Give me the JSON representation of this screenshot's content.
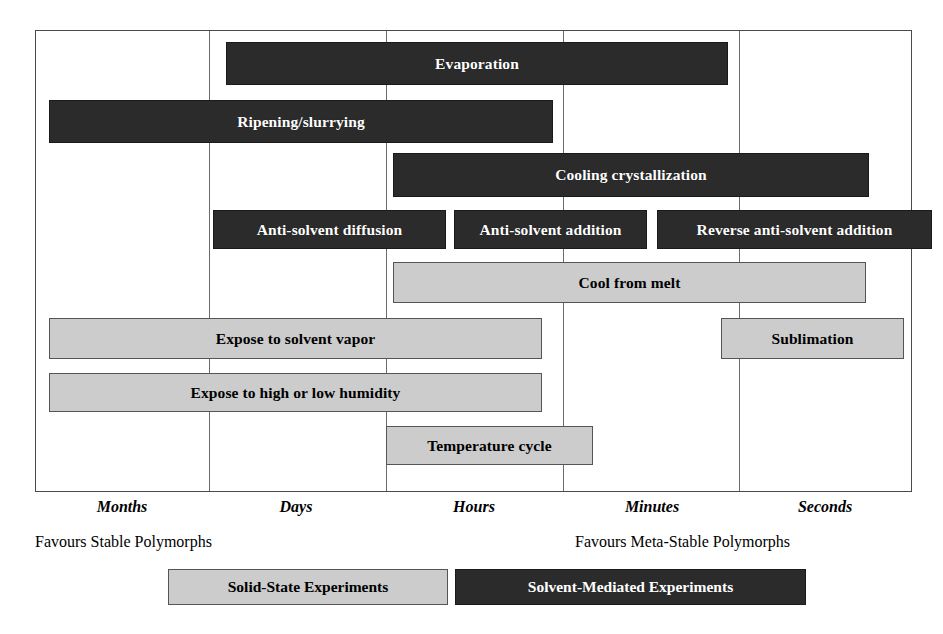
{
  "figure": {
    "colors": {
      "solid_state": "#cccccc",
      "solvent_mediated": "#2b2b2b",
      "frame": "#4a4a4a",
      "gridline": "#6b6b6b",
      "background": "#ffffff"
    }
  },
  "axis": {
    "label": "Timescale",
    "ticks": [
      {
        "label": "Months",
        "x": 122
      },
      {
        "label": "Days",
        "x": 296
      },
      {
        "label": "Hours",
        "x": 474
      },
      {
        "label": "Minutes",
        "x": 652
      },
      {
        "label": "Seconds",
        "x": 825
      }
    ],
    "gridline_positions": [
      208,
      385,
      562,
      738
    ]
  },
  "captions": {
    "left": "Favours Stable Polymorphs",
    "right": "Favours Meta-Stable Polymorphs"
  },
  "legend": {
    "items": [
      {
        "label": "Solid-State Experiments",
        "type": "solid_state"
      },
      {
        "label": "Solvent-Mediated Experiments",
        "type": "solvent_mediated"
      }
    ]
  },
  "chart_data": {
    "type": "bar",
    "xlabel": "Timescale",
    "ylabel": "",
    "grid": true,
    "legend_position": "bottom",
    "categories": [
      "Months",
      "Days",
      "Hours",
      "Minutes",
      "Seconds"
    ],
    "bars": [
      {
        "label": "Evaporation",
        "type": "solvent_mediated",
        "row": 1,
        "start_label": "Days",
        "end_label": "Minutes",
        "x": 225,
        "y": 41,
        "width": 502,
        "height": 43
      },
      {
        "label": "Ripening/slurrying",
        "type": "solvent_mediated",
        "row": 2,
        "start_label": "Months",
        "end_label": "Hours",
        "x": 48,
        "y": 99,
        "width": 504,
        "height": 43
      },
      {
        "label": "Cooling crystallization",
        "type": "solvent_mediated",
        "row": 3,
        "start_label": "Hours",
        "end_label": "Seconds",
        "x": 392,
        "y": 152,
        "width": 476,
        "height": 44
      },
      {
        "label": "Anti-solvent diffusion",
        "type": "solvent_mediated",
        "row": 4,
        "start_label": "Days",
        "end_label": "Hours",
        "x": 212,
        "y": 209,
        "width": 233,
        "height": 39
      },
      {
        "label": "Anti-solvent addition",
        "type": "solvent_mediated",
        "row": 4,
        "start_label": "Hours",
        "end_label": "Minutes",
        "x": 453,
        "y": 209,
        "width": 193,
        "height": 39
      },
      {
        "label": "Reverse anti-solvent addition",
        "type": "solvent_mediated",
        "row": 4,
        "start_label": "Minutes",
        "end_label": "Seconds",
        "x": 656,
        "y": 209,
        "width": 275,
        "height": 39
      },
      {
        "label": "Cool from melt",
        "type": "solid_state",
        "row": 5,
        "start_label": "Hours",
        "end_label": "Seconds",
        "x": 392,
        "y": 261,
        "width": 473,
        "height": 41
      },
      {
        "label": "Expose to solvent vapor",
        "type": "solid_state",
        "row": 6,
        "start_label": "Months",
        "end_label": "Hours",
        "x": 48,
        "y": 317,
        "width": 493,
        "height": 41
      },
      {
        "label": "Sublimation",
        "type": "solid_state",
        "row": 6,
        "start_label": "Minutes",
        "end_label": "Seconds",
        "x": 720,
        "y": 317,
        "width": 183,
        "height": 41
      },
      {
        "label": "Expose to high or low humidity",
        "type": "solid_state",
        "row": 7,
        "start_label": "Months",
        "end_label": "Hours",
        "x": 48,
        "y": 372,
        "width": 493,
        "height": 39
      },
      {
        "label": "Temperature cycle",
        "type": "solid_state",
        "row": 8,
        "start_label": "Hours",
        "end_label": "Minutes",
        "x": 385,
        "y": 425,
        "width": 207,
        "height": 39
      }
    ]
  }
}
